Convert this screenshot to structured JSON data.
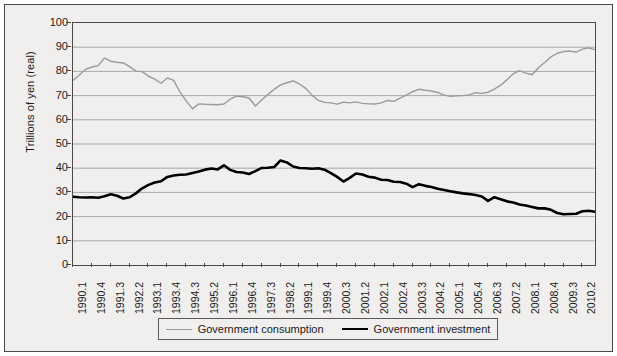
{
  "chart_data": {
    "type": "line",
    "title": "",
    "xlabel": "",
    "ylabel": "Trillions of yen (real)",
    "ylim": [
      0,
      100
    ],
    "ytick_values": [
      100,
      90,
      80,
      70,
      60,
      50,
      40,
      30,
      20,
      10,
      0
    ],
    "grid": true,
    "legend_position": "bottom",
    "categories": [
      "1990.1",
      "1990.2",
      "1990.3",
      "1990.4",
      "1991.1",
      "1991.2",
      "1991.3",
      "1991.4",
      "1992.1",
      "1992.2",
      "1992.3",
      "1992.4",
      "1993.1",
      "1993.2",
      "1993.3",
      "1993.4",
      "1994.1",
      "1994.2",
      "1994.3",
      "1994.4",
      "1995.1",
      "1995.2",
      "1995.3",
      "1995.4",
      "1996.1",
      "1996.2",
      "1996.3",
      "1996.4",
      "1997.1",
      "1997.2",
      "1997.3",
      "1997.4",
      "1998.1",
      "1998.2",
      "1998.3",
      "1998.4",
      "1999.1",
      "1999.2",
      "1999.3",
      "1999.4",
      "2000.1",
      "2000.2",
      "2000.3",
      "2000.4",
      "2001.1",
      "2001.2",
      "2001.3",
      "2001.4",
      "2002.1",
      "2002.2",
      "2002.3",
      "2002.4",
      "2003.1",
      "2003.2",
      "2003.3",
      "2003.4",
      "2004.1",
      "2004.2",
      "2004.3",
      "2004.4",
      "2005.1",
      "2005.2",
      "2005.3",
      "2005.4",
      "2006.1",
      "2006.2",
      "2006.3",
      "2006.4",
      "2007.1",
      "2007.2",
      "2007.3",
      "2007.4",
      "2008.1",
      "2008.2",
      "2008.3",
      "2008.4",
      "2009.1",
      "2009.2",
      "2009.3",
      "2009.4",
      "2010.1",
      "2010.2",
      "2010.3",
      "2010.4"
    ],
    "xtick_labels": [
      "1990.1",
      "1990.4",
      "1991.3",
      "1992.2",
      "1993.1",
      "1993.4",
      "1994.3",
      "1995.2",
      "1996.1",
      "1996.4",
      "1997.3",
      "1998.2",
      "1999.1",
      "1999.4",
      "2000.3",
      "2001.2",
      "2002.1",
      "2002.4",
      "2003.3",
      "2004.2",
      "2005.1",
      "2005.4",
      "2006.3",
      "2007.2",
      "2008.1",
      "2008.4",
      "2009.3",
      "2010.2"
    ],
    "xtick_indices": [
      0,
      3,
      6,
      9,
      12,
      15,
      18,
      21,
      24,
      27,
      30,
      33,
      36,
      39,
      42,
      45,
      48,
      51,
      54,
      57,
      60,
      63,
      66,
      69,
      72,
      75,
      78,
      81
    ],
    "series": [
      {
        "name": "Government consumption",
        "color": "#9a9a9a",
        "width": 1.4,
        "values": [
          76.3,
          78.5,
          80.8,
          81.8,
          82.4,
          85.5,
          84.2,
          83.8,
          83.5,
          82.0,
          80.1,
          79.9,
          78.0,
          76.8,
          75.1,
          77.3,
          76.3,
          71.5,
          67.8,
          64.5,
          66.6,
          66.4,
          66.3,
          66.2,
          66.5,
          68.5,
          69.8,
          69.5,
          69.0,
          65.7,
          68.2,
          70.5,
          72.6,
          74.4,
          75.3,
          76.1,
          74.8,
          73.0,
          70.2,
          68.0,
          67.2,
          67.0,
          66.5,
          67.3,
          67.0,
          67.4,
          66.8,
          66.6,
          66.5,
          67.0,
          68.0,
          67.6,
          69.0,
          70.2,
          71.6,
          72.6,
          72.2,
          71.9,
          71.3,
          70.2,
          69.7,
          69.9,
          70.0,
          70.3,
          71.2,
          70.9,
          71.4,
          72.7,
          74.3,
          76.5,
          79.0,
          80.3,
          79.3,
          78.6,
          81.5,
          83.7,
          86.0,
          87.5,
          88.2,
          88.4,
          88.0,
          89.2,
          89.7,
          89.0
        ]
      },
      {
        "name": "Government investment",
        "color": "#000000",
        "width": 2.6,
        "values": [
          28.2,
          28.0,
          27.9,
          28.0,
          27.8,
          28.4,
          29.2,
          28.6,
          27.5,
          28.0,
          29.6,
          31.7,
          33.1,
          34.1,
          34.6,
          36.4,
          37.0,
          37.3,
          37.4,
          38.0,
          38.6,
          39.4,
          39.9,
          39.5,
          41.2,
          39.3,
          38.4,
          38.2,
          37.6,
          38.8,
          40.1,
          40.2,
          40.5,
          43.2,
          42.4,
          40.7,
          40.1,
          40.0,
          39.8,
          40.0,
          39.4,
          38.0,
          36.4,
          34.5,
          36.0,
          37.8,
          37.4,
          36.5,
          36.1,
          35.2,
          35.1,
          34.4,
          34.3,
          33.6,
          32.2,
          33.4,
          32.7,
          32.2,
          31.5,
          31.0,
          30.5,
          30.0,
          29.6,
          29.3,
          28.9,
          28.3,
          26.5,
          28.0,
          27.2,
          26.3,
          25.8,
          25.0,
          24.6,
          24.0,
          23.4,
          23.4,
          22.8,
          21.5,
          21.0,
          21.1,
          21.2,
          22.2,
          22.4,
          22.0
        ]
      }
    ]
  },
  "axis": {
    "ylabel": "Trillions of yen (real)"
  },
  "legend": {
    "entries": [
      {
        "label": "Government consumption"
      },
      {
        "label": "Government investment"
      }
    ]
  }
}
